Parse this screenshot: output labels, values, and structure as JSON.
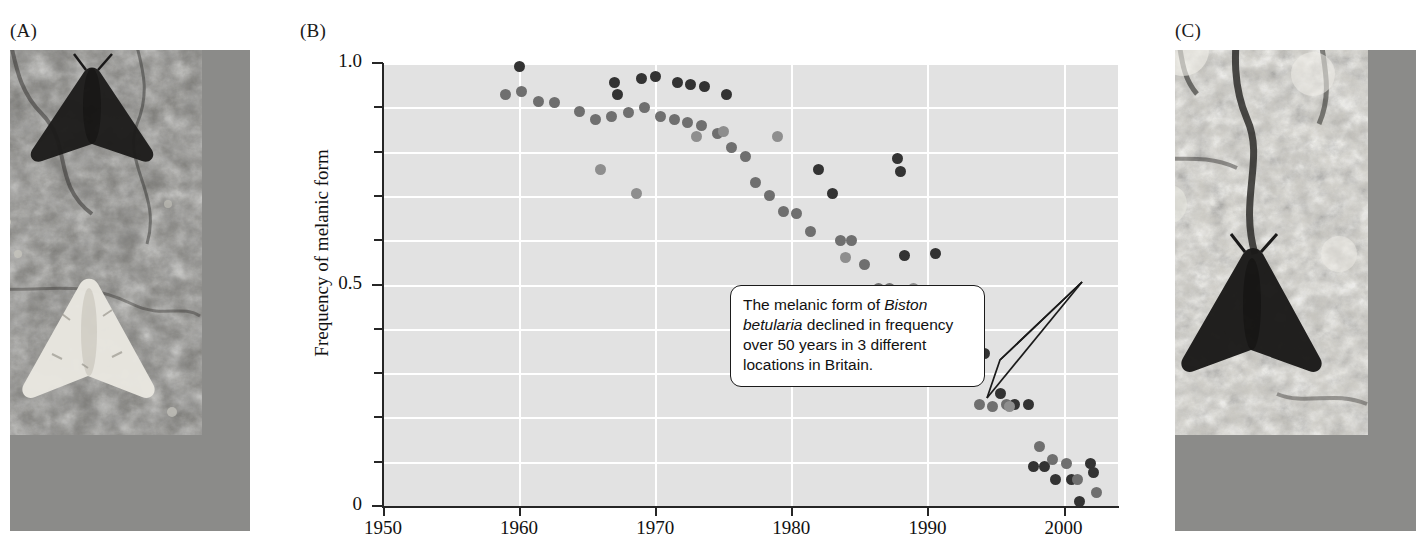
{
  "panels": {
    "a": {
      "label": "(A)",
      "alt": "Dark melanic peppered moth and pale typical moth resting on dark soot-covered bark"
    },
    "b": {
      "label": "(B)"
    },
    "c": {
      "label": "(C)",
      "alt": "Dark melanic peppered moth resting on pale lichen-covered bark"
    }
  },
  "callout": {
    "line1_pre": "The melanic form of ",
    "line1_em": "Biston",
    "line2_em": "betularia",
    "line2_post": " declined in frequency",
    "line3": "over 50 years in 3 different",
    "line4": "locations in Britain.",
    "full_text": "The melanic form of Biston betularia declined in frequency over 50 years in 3 different locations in Britain."
  },
  "colors": {
    "plot_background": "#e2e2e2",
    "gridline": "#ffffff",
    "axis": "#262626",
    "series_dark": "#333333",
    "series_mid": "#6f6f6f",
    "series_light": "#8e8e8e",
    "callout_border": "#1b1b1b",
    "text": "#111111"
  },
  "chart_data": {
    "type": "scatter",
    "title": "",
    "xlabel": "",
    "ylabel": "Frequency of melanic form",
    "xlim": [
      1950,
      2004
    ],
    "ylim": [
      0,
      1.0
    ],
    "xticks": [
      1950,
      1960,
      1970,
      1980,
      1990,
      2000
    ],
    "xticklabels": [
      "1950",
      "1960",
      "1970",
      "1980",
      "1990",
      "2000"
    ],
    "yticks": [
      0,
      0.1,
      0.2,
      0.3,
      0.4,
      0.5,
      0.6,
      0.7,
      0.8,
      0.9,
      1.0
    ],
    "yticklabels_shown": {
      "0": "0",
      "0.5": "0.5",
      "1": "1.0"
    },
    "grid": "horizontal and vertical white gridlines at every 0.1 y and every decade x",
    "legend": "none",
    "series": [
      {
        "name": "Location 1 (dark markers)",
        "color": "#333333",
        "points": [
          [
            1960.0,
            0.992
          ],
          [
            1967.0,
            0.955
          ],
          [
            1967.2,
            0.93
          ],
          [
            1969.0,
            0.965
          ],
          [
            1970.0,
            0.97
          ],
          [
            1971.6,
            0.955
          ],
          [
            1972.6,
            0.952
          ],
          [
            1973.6,
            0.948
          ],
          [
            1975.2,
            0.93
          ],
          [
            1982.0,
            0.76
          ],
          [
            1983.0,
            0.705
          ],
          [
            1987.8,
            0.785
          ],
          [
            1988.0,
            0.755
          ],
          [
            1988.3,
            0.565
          ],
          [
            1990.6,
            0.57
          ],
          [
            1991.4,
            0.4
          ],
          [
            1992.6,
            0.4
          ],
          [
            1994.2,
            0.345
          ],
          [
            1995.4,
            0.255
          ],
          [
            1996.4,
            0.23
          ],
          [
            1997.4,
            0.23
          ],
          [
            1997.8,
            0.09
          ],
          [
            1998.6,
            0.09
          ],
          [
            1999.4,
            0.06
          ],
          [
            2000.6,
            0.06
          ],
          [
            2001.2,
            0.01
          ],
          [
            2002.0,
            0.095
          ],
          [
            2002.2,
            0.075
          ]
        ]
      },
      {
        "name": "Location 2 (mid-gray markers)",
        "color": "#6f6f6f",
        "points": [
          [
            1959.0,
            0.93
          ],
          [
            1960.2,
            0.935
          ],
          [
            1961.4,
            0.912
          ],
          [
            1962.6,
            0.91
          ],
          [
            1964.4,
            0.89
          ],
          [
            1965.6,
            0.872
          ],
          [
            1966.8,
            0.88
          ],
          [
            1968.0,
            0.888
          ],
          [
            1969.2,
            0.9
          ],
          [
            1970.4,
            0.88
          ],
          [
            1971.4,
            0.872
          ],
          [
            1972.4,
            0.865
          ],
          [
            1973.4,
            0.86
          ],
          [
            1974.6,
            0.84
          ],
          [
            1975.6,
            0.81
          ],
          [
            1976.6,
            0.79
          ],
          [
            1977.4,
            0.73
          ],
          [
            1978.4,
            0.7
          ],
          [
            1979.4,
            0.665
          ],
          [
            1980.4,
            0.66
          ],
          [
            1981.4,
            0.62
          ],
          [
            1983.6,
            0.6
          ],
          [
            1984.4,
            0.6
          ],
          [
            1985.4,
            0.545
          ],
          [
            1986.4,
            0.49
          ],
          [
            1987.2,
            0.49
          ],
          [
            1988.6,
            0.43
          ],
          [
            1989.6,
            0.3
          ],
          [
            1990.4,
            0.42
          ],
          [
            1991.6,
            0.345
          ],
          [
            1992.4,
            0.345
          ],
          [
            1993.4,
            0.3
          ],
          [
            1993.8,
            0.23
          ],
          [
            1994.8,
            0.225
          ],
          [
            1995.8,
            0.23
          ],
          [
            1998.2,
            0.135
          ],
          [
            1999.2,
            0.105
          ],
          [
            2000.2,
            0.095
          ],
          [
            2001.0,
            0.06
          ],
          [
            2002.4,
            0.03
          ]
        ]
      },
      {
        "name": "Location 3 (light-gray markers)",
        "color": "#8e8e8e",
        "points": [
          [
            1966.0,
            0.76
          ],
          [
            1968.6,
            0.705
          ],
          [
            1973.0,
            0.835
          ],
          [
            1975.0,
            0.845
          ],
          [
            1979.0,
            0.835
          ],
          [
            1984.0,
            0.56
          ],
          [
            1989.0,
            0.49
          ],
          [
            1996.0,
            0.225
          ]
        ]
      }
    ]
  }
}
